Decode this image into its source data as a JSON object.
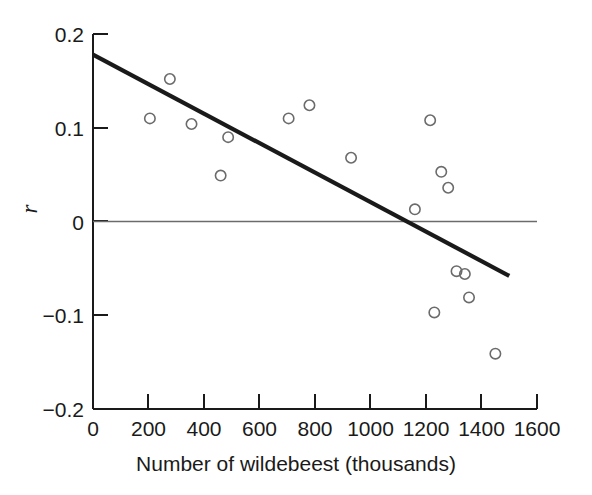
{
  "chart_data": {
    "type": "scatter",
    "title": "",
    "xlabel": "Number of wildebeest (thousands)",
    "ylabel": "r",
    "xlim": [
      0,
      1600
    ],
    "ylim": [
      -0.2,
      0.2
    ],
    "xticks": [
      0,
      200,
      400,
      600,
      800,
      1000,
      1200,
      1400,
      1600
    ],
    "xtick_labels": [
      "0",
      "200",
      "400",
      "600",
      "800",
      "1000",
      "1200",
      "1400",
      "1600"
    ],
    "yticks": [
      0.2,
      0.1,
      0,
      -0.1,
      -0.2
    ],
    "ytick_labels": [
      "0.2",
      "0.1",
      "0",
      "−0.1",
      "−0.2"
    ],
    "grid": false,
    "legend": null,
    "marker": "open-circle",
    "points": [
      {
        "x": 205,
        "y": 0.11
      },
      {
        "x": 277,
        "y": 0.152
      },
      {
        "x": 355,
        "y": 0.104
      },
      {
        "x": 460,
        "y": 0.049
      },
      {
        "x": 487,
        "y": 0.09
      },
      {
        "x": 705,
        "y": 0.11
      },
      {
        "x": 780,
        "y": 0.124
      },
      {
        "x": 930,
        "y": 0.068
      },
      {
        "x": 1160,
        "y": 0.013
      },
      {
        "x": 1215,
        "y": 0.108
      },
      {
        "x": 1230,
        "y": -0.097
      },
      {
        "x": 1255,
        "y": 0.053
      },
      {
        "x": 1280,
        "y": 0.036
      },
      {
        "x": 1310,
        "y": -0.053
      },
      {
        "x": 1340,
        "y": -0.056
      },
      {
        "x": 1355,
        "y": -0.081
      },
      {
        "x": 1450,
        "y": -0.141
      }
    ],
    "trend_line": {
      "type": "linear-regression",
      "x_start": 0,
      "y_start": 0.178,
      "x_end": 1500,
      "y_end": -0.058,
      "slope_per_1000": -0.157,
      "intercept": 0.178
    },
    "reference_line": {
      "orientation": "horizontal",
      "y": 0,
      "x_start": 0,
      "x_end": 1600
    },
    "colors": {
      "axis": "#1a1a1a",
      "marker_stroke": "#6b6b6b",
      "trend_line": "#1a1a1a",
      "reference_line": "#6b6b6b",
      "background": "#ffffff"
    }
  }
}
